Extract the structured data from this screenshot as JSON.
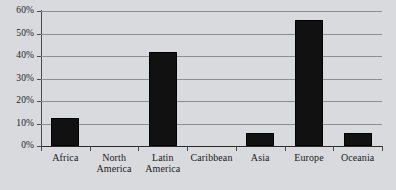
{
  "chart_data": {
    "type": "bar",
    "title": "",
    "subtitle": "",
    "xlabel": "",
    "ylabel": "",
    "categories": [
      "Africa",
      "North America",
      "Latin America",
      "Caribbean",
      "Asia",
      "Europe",
      "Oceania"
    ],
    "values": [
      12.5,
      0,
      42,
      0,
      6,
      56,
      6
    ],
    "ylim": [
      0,
      60
    ],
    "ytick_labels": [
      "60%",
      "50%",
      "40%",
      "30%",
      "20%",
      "10%",
      "0%"
    ],
    "ytick_values": [
      60,
      50,
      40,
      30,
      20,
      10,
      0
    ],
    "grid": true,
    "legend": "none",
    "series": [
      {
        "name": "",
        "values": [
          12.5,
          0,
          42,
          0,
          6,
          56,
          6
        ]
      }
    ],
    "colors": {
      "bar": "#111111",
      "background": "#d9dade",
      "gridline": "#8d8f94",
      "axis": "#4a4a4c",
      "text": "#1a1a1a"
    }
  },
  "category_lines": [
    [
      "Africa"
    ],
    [
      "North",
      "America"
    ],
    [
      "Latin",
      "America"
    ],
    [
      "Caribbean"
    ],
    [
      "Asia"
    ],
    [
      "Europe"
    ],
    [
      "Oceania"
    ]
  ]
}
